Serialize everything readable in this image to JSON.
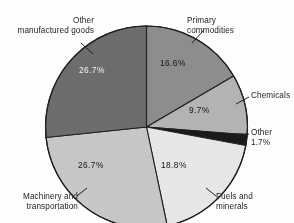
{
  "chart_data": {
    "type": "pie",
    "title": "",
    "subtitle": "",
    "xlabel": "",
    "ylabel": "",
    "legend_position": "none",
    "labels_position": "outside-with-leader-lines",
    "start_angle_deg": 0,
    "direction": "clockwise",
    "categories": [
      "Primary commodities",
      "Chemicals",
      "Other",
      "Fuels and minerals",
      "Machinery and transportation",
      "Other manufactured goods"
    ],
    "values": [
      16.6,
      9.7,
      1.7,
      18.8,
      26.7,
      26.7
    ],
    "value_labels": [
      "16.6%",
      "9.7%",
      "1.7%",
      "18.8%",
      "26.7%",
      "26.7%"
    ],
    "colors": [
      "#8e8e8e",
      "#b4b4b4",
      "#1a1a1a",
      "#e8e8e8",
      "#c8c8c8",
      "#6d6d6d"
    ],
    "units": "percent"
  },
  "figure": {
    "title": "",
    "slices": [
      {
        "name": "Primary commodities",
        "label": "Primary\ncommodities",
        "percent_label": "16.6%",
        "value": 16.6,
        "color": "#8e8e8e",
        "label_color": "dark"
      },
      {
        "name": "Chemicals",
        "label": "Chemicals",
        "percent_label": "9.7%",
        "value": 9.7,
        "color": "#b4b4b4",
        "label_color": "dark"
      },
      {
        "name": "Other",
        "label": "Other\n1.7%",
        "percent_label": "1.7%",
        "value": 1.7,
        "color": "#1a1a1a",
        "label_color": "dark"
      },
      {
        "name": "Fuels and minerals",
        "label": "Fuels and\nminerals",
        "percent_label": "18.8%",
        "value": 18.8,
        "color": "#e8e8e8",
        "label_color": "dark"
      },
      {
        "name": "Machinery and transportation",
        "label": "Machinery and\ntransportation",
        "percent_label": "26.7%",
        "value": 26.7,
        "color": "#c8c8c8",
        "label_color": "dark"
      },
      {
        "name": "Other manufactured goods",
        "label": "Other\nmanufactured goods",
        "percent_label": "26.7%",
        "value": 26.7,
        "color": "#6d6d6d",
        "label_color": "light"
      }
    ]
  }
}
